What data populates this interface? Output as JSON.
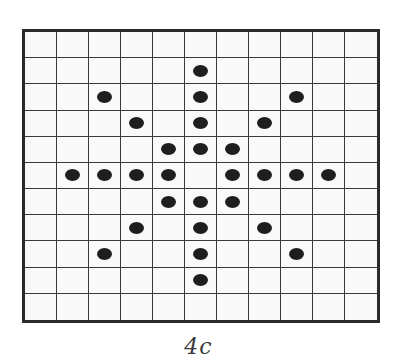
{
  "figure": {
    "caption": "4c",
    "grid": {
      "columns": 11,
      "rows": 11,
      "dot_color": "#1e1e1e",
      "line_color": "#3a3a3a",
      "cell_color": "#f9f9f9",
      "dots": [
        {
          "row": 1,
          "col": 5
        },
        {
          "row": 2,
          "col": 2
        },
        {
          "row": 2,
          "col": 5
        },
        {
          "row": 2,
          "col": 8
        },
        {
          "row": 3,
          "col": 3
        },
        {
          "row": 3,
          "col": 5
        },
        {
          "row": 3,
          "col": 7
        },
        {
          "row": 4,
          "col": 4
        },
        {
          "row": 4,
          "col": 5
        },
        {
          "row": 4,
          "col": 6
        },
        {
          "row": 5,
          "col": 1
        },
        {
          "row": 5,
          "col": 2
        },
        {
          "row": 5,
          "col": 3
        },
        {
          "row": 5,
          "col": 4
        },
        {
          "row": 5,
          "col": 6
        },
        {
          "row": 5,
          "col": 7
        },
        {
          "row": 5,
          "col": 8
        },
        {
          "row": 5,
          "col": 9
        },
        {
          "row": 6,
          "col": 4
        },
        {
          "row": 6,
          "col": 5
        },
        {
          "row": 6,
          "col": 6
        },
        {
          "row": 7,
          "col": 3
        },
        {
          "row": 7,
          "col": 5
        },
        {
          "row": 7,
          "col": 7
        },
        {
          "row": 8,
          "col": 2
        },
        {
          "row": 8,
          "col": 5
        },
        {
          "row": 8,
          "col": 8
        },
        {
          "row": 9,
          "col": 5
        }
      ]
    }
  }
}
